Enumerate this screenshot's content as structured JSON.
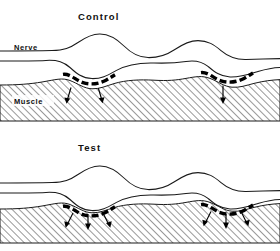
{
  "figure": {
    "title_top": "Control",
    "title_bottom": "Test",
    "labels": {
      "nerve": "Nerve",
      "muscle": "Muscle"
    },
    "colors": {
      "ink": "#1a1a1a",
      "bouton": "#000000",
      "muscle_hatch": "#555555",
      "background": "#ffffff"
    },
    "panels": [
      {
        "id": "control",
        "title": "Control",
        "synapses": [
          {
            "id": "control-synapse-left",
            "arrow_count": 2
          },
          {
            "id": "control-synapse-right",
            "arrow_count": 1
          }
        ]
      },
      {
        "id": "test",
        "title": "Test",
        "synapses": [
          {
            "id": "test-synapse-left",
            "arrow_count": 3
          },
          {
            "id": "test-synapse-right",
            "arrow_count": 3
          }
        ]
      }
    ]
  }
}
